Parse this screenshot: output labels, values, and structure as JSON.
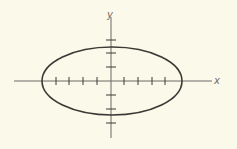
{
  "diagram": {
    "type": "ellipse-on-axes",
    "background": "#FBF9EA",
    "stroke_color": "#3a3a36",
    "axis_color": "#6b6b66",
    "origin_px": [
      111,
      81
    ],
    "x_axis": {
      "label": "x",
      "from_px": 14,
      "to_px": 212,
      "ticks_px": [
        56,
        69,
        83,
        97,
        124,
        138,
        152,
        165
      ]
    },
    "y_axis": {
      "label": "y",
      "from_px": 17,
      "to_px": 138,
      "ticks_px": [
        40,
        53,
        67,
        95,
        109,
        123
      ]
    },
    "ellipse": {
      "cx": 112,
      "cy": 81,
      "rx": 70,
      "ry": 34
    }
  }
}
